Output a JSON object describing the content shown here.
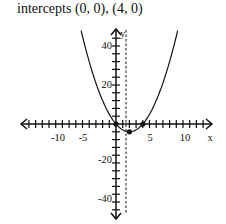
{
  "title": "intercepts (0, 0), (4, 0)",
  "axes": {
    "x_label": "x",
    "y_label": "y",
    "x_ticks": [
      "-10",
      "-5",
      "5",
      "10"
    ],
    "y_ticks": [
      "40",
      "20",
      "-20",
      "-40"
    ]
  },
  "chart_data": {
    "type": "line",
    "title": "intercepts (0, 0), (4, 0)",
    "xlabel": "x",
    "ylabel": "y",
    "function": "y = x^2 - 4x",
    "xlim": [
      -13,
      13
    ],
    "ylim": [
      -48,
      48
    ],
    "x_tick_labels": [
      -10,
      -5,
      5,
      10
    ],
    "y_tick_labels": [
      -40,
      -20,
      20,
      40
    ],
    "x_minor_tick_step": 1,
    "y_minor_tick_step": 4,
    "series": [
      {
        "name": "parabola",
        "x": [
          -5.5,
          -4,
          -2,
          0,
          2,
          4,
          6,
          8,
          9.5
        ],
        "y": [
          52.25,
          32,
          12,
          0,
          -4,
          0,
          12,
          32,
          52.25
        ]
      }
    ],
    "points": [
      {
        "label": "x-intercept",
        "x": 0,
        "y": 0
      },
      {
        "label": "x-intercept",
        "x": 4,
        "y": 0
      },
      {
        "label": "vertex",
        "x": 2,
        "y": -4
      }
    ],
    "axis_of_symmetry": {
      "x": 2,
      "style": "dashed"
    },
    "grid": false
  }
}
